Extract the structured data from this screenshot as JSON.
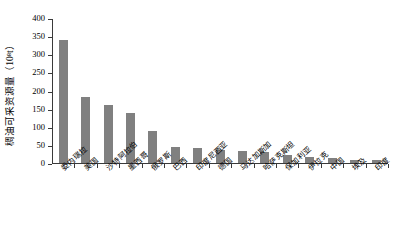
{
  "chart_data": {
    "type": "bar",
    "title": "",
    "xlabel": "",
    "ylabel": "稠油可采资源量（10⁸t）",
    "ylabel_plain": "稠油可采资源量（10^8 t）",
    "ylim": [
      0,
      400
    ],
    "ytick_interval": 50,
    "yticks": [
      0,
      50,
      100,
      150,
      200,
      250,
      300,
      350,
      400
    ],
    "ytick_labels": [
      "0",
      "50",
      "100",
      "150",
      "200",
      "250",
      "300",
      "350",
      "400"
    ],
    "grid": false,
    "legend": false,
    "bar_color": "#808080",
    "axis_color": "#3a3a3a",
    "categories": [
      "委内瑞拉",
      "美国",
      "沙特阿拉伯",
      "墨西哥",
      "俄罗斯",
      "巴西",
      "印度尼西亚",
      "德国",
      "马达加斯加",
      "哈萨克斯坦",
      "保加利亚",
      "伊拉克",
      "中国",
      "埃及",
      "印度"
    ],
    "values": [
      340,
      182,
      160,
      138,
      88,
      43,
      42,
      36,
      32,
      31,
      21,
      17,
      15,
      9,
      8
    ]
  }
}
